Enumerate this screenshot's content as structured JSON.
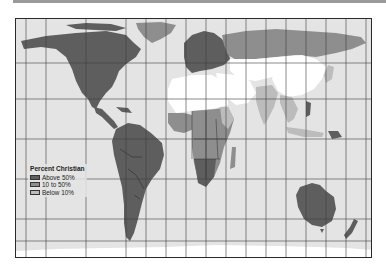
{
  "map": {
    "title": "Percent Christian",
    "projection": "Peters (equal-area) world map",
    "colors": {
      "ocean": "#e4e4e4",
      "above_50": "#5e5e5e",
      "ten_to_50": "#8e8e8e",
      "below_10_light": "#bcbcbc",
      "below_10_white": "#ffffff",
      "grid": "#3c3c3c",
      "border": "#2a2a2a"
    },
    "regions": [
      {
        "name": "North America",
        "category": "Above 50%"
      },
      {
        "name": "Greenland",
        "category": "10 to 50%"
      },
      {
        "name": "Central America",
        "category": "Above 50%"
      },
      {
        "name": "South America",
        "category": "Above 50%"
      },
      {
        "name": "Europe",
        "category": "Above 50%"
      },
      {
        "name": "Russia",
        "category": "10 to 50%"
      },
      {
        "name": "North Africa",
        "category": "Below 10%"
      },
      {
        "name": "Middle East",
        "category": "Below 10%"
      },
      {
        "name": "Central Asia",
        "category": "Below 10%"
      },
      {
        "name": "Sub-Saharan Africa",
        "category": "10 to 50%"
      },
      {
        "name": "Southern Africa",
        "category": "Above 50%"
      },
      {
        "name": "Madagascar",
        "category": "10 to 50%"
      },
      {
        "name": "India",
        "category": "Below 10%"
      },
      {
        "name": "China",
        "category": "Below 10%"
      },
      {
        "name": "Southeast Asia",
        "category": "Below 10%"
      },
      {
        "name": "Philippines",
        "category": "Above 50%"
      },
      {
        "name": "Australia",
        "category": "Above 50%"
      },
      {
        "name": "New Zealand",
        "category": "Above 50%"
      },
      {
        "name": "Papua New Guinea",
        "category": "Above 50%"
      },
      {
        "name": "Antarctica",
        "category": "none"
      }
    ]
  },
  "legend": {
    "title": "Percent Christian",
    "items": [
      {
        "label": "Above 50%",
        "color": "#5e5e5e"
      },
      {
        "label": "10 to 50%",
        "color": "#8e8e8e"
      },
      {
        "label": "Below 10%",
        "color": "#bcbcbc"
      }
    ]
  }
}
